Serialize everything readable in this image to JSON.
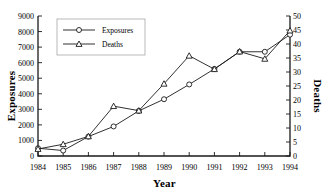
{
  "chart_data": {
    "type": "line",
    "title": "",
    "xlabel": "Year",
    "ylabel": "Exposures",
    "y2label": "Deaths",
    "categories": [
      1984,
      1985,
      1986,
      1987,
      1988,
      1989,
      1990,
      1991,
      1992,
      1993,
      1994
    ],
    "xtick_labels": [
      "1984",
      "1985",
      "1986",
      "1987",
      "1988",
      "1989",
      "1990",
      "1991",
      "1992",
      "1993",
      "1994"
    ],
    "ylim": [
      0,
      9000
    ],
    "ytick_labels": [
      "0",
      "1000",
      "2000",
      "3000",
      "4000",
      "5000",
      "6000",
      "7000",
      "8000",
      "9000"
    ],
    "yticks": [
      0,
      1000,
      2000,
      3000,
      4000,
      5000,
      6000,
      7000,
      8000,
      9000
    ],
    "y2lim": [
      0,
      50
    ],
    "y2tick_labels": [
      "0",
      "5",
      "10",
      "15",
      "20",
      "25",
      "30",
      "35",
      "40",
      "45",
      "50"
    ],
    "y2ticks": [
      0,
      5,
      10,
      15,
      20,
      25,
      30,
      35,
      40,
      45,
      50
    ],
    "grid": false,
    "legend_position": "upper-left",
    "series": [
      {
        "name": "Exposures",
        "axis": "left",
        "marker": "circle",
        "values": [
          500,
          350,
          1250,
          1900,
          2900,
          3650,
          4600,
          5600,
          6700,
          6700,
          7800
        ]
      },
      {
        "name": "Deaths",
        "axis": "right",
        "marker": "triangle",
        "values": [
          2.5,
          4.2,
          7.0,
          17.8,
          16.2,
          25.8,
          35.8,
          31.0,
          37.3,
          34.7,
          44.8
        ]
      }
    ],
    "colors": {
      "line": "#1a1a1a",
      "marker_fill": "#ffffff",
      "axis": "#1a1a1a",
      "legend_border": "#9a9a9a",
      "background": "#ffffff"
    }
  }
}
